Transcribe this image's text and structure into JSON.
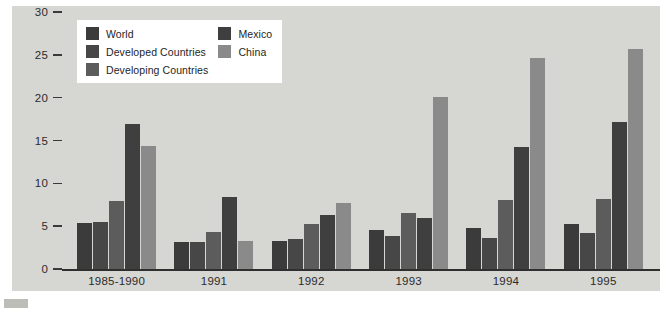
{
  "chart_data": {
    "type": "bar",
    "title": "",
    "subtitle": "",
    "xlabel": "",
    "ylabel": "",
    "categories": [
      "1985-1990",
      "1991",
      "1992",
      "1993",
      "1994",
      "1995"
    ],
    "ylim": [
      0,
      30
    ],
    "yticks": [
      0,
      5,
      10,
      15,
      20,
      25,
      30
    ],
    "ytick_labels": [
      "0",
      "5",
      "10",
      "15",
      "20",
      "25",
      "30"
    ],
    "grid": false,
    "legend_position": "top-left",
    "series": [
      {
        "name": "World",
        "color": "#3b3b3b",
        "values": [
          5.4,
          3.1,
          3.3,
          4.5,
          4.8,
          5.3
        ]
      },
      {
        "name": "Developed Countries",
        "color": "#474747",
        "values": [
          5.5,
          3.2,
          3.5,
          3.8,
          3.6,
          4.2
        ]
      },
      {
        "name": "Developing Countries",
        "color": "#5c5c5c",
        "values": [
          7.9,
          4.3,
          5.2,
          6.5,
          8.0,
          8.2
        ]
      },
      {
        "name": "Mexico",
        "color": "#3f3f3f",
        "values": [
          16.9,
          8.4,
          6.3,
          5.9,
          14.2,
          17.2
        ]
      },
      {
        "name": "China",
        "color": "#8a8a8a",
        "values": [
          14.4,
          3.3,
          7.7,
          20.1,
          24.6,
          25.7
        ]
      }
    ]
  },
  "legend": {
    "columns": [
      [
        "World",
        "Developed Countries",
        "Developing Countries"
      ],
      [
        "Mexico",
        "China"
      ]
    ]
  }
}
